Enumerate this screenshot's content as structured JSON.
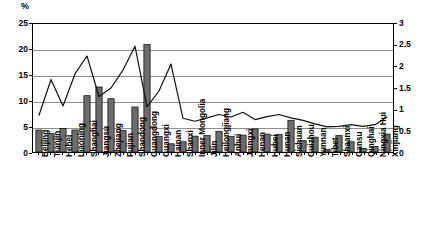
{
  "axes": {
    "left_unit_label": "%",
    "left_ticks": [
      "0",
      "5",
      "10",
      "15",
      "20",
      "25"
    ],
    "right_ticks": [
      "0",
      "0.5",
      "1",
      "1.5",
      "2",
      "2.5",
      "3"
    ]
  },
  "chart_data": {
    "type": "bar",
    "title": "",
    "subtitle": "",
    "xlabel": "",
    "ylabel": "%",
    "ylim": [
      0,
      25
    ],
    "y2lim": [
      0,
      3
    ],
    "grid": true,
    "legend": "none",
    "categories": [
      "Beijing",
      "Tianjin",
      "Hebei",
      "Liaoning",
      "Shanghai",
      "Jiangsu",
      "Zhejiang",
      "Fujian",
      "Shandong",
      "Guangdong",
      "Guangxi",
      "Hainan",
      "Shanxi",
      "Inner Mongolia",
      "Jilin",
      "Heilongjiang",
      "Anhui",
      "Jaingxi",
      "Henan",
      "Hubei",
      "Hunan",
      "Sichuan",
      "Guizhou",
      "Yunnan",
      "Tibet",
      "Shaanxi",
      "Gansu",
      "Qinghai",
      "Ningxia Hui",
      "Xinjiang"
    ],
    "series": [
      {
        "name": "bars",
        "axis": "left",
        "type": "bar",
        "color": "#6d6d6d",
        "values": [
          4.3,
          3.6,
          4.6,
          4.3,
          11.0,
          12.7,
          10.4,
          4.2,
          8.8,
          21.0,
          3.0,
          1.6,
          2.0,
          3.1,
          3.2,
          4.0,
          3.0,
          3.3,
          4.5,
          3.5,
          3.4,
          6.2,
          2.2,
          2.9,
          0.5,
          3.2,
          2.0,
          0.7,
          1.1,
          3.5
        ]
      },
      {
        "name": "line",
        "axis": "right",
        "type": "line",
        "color": "#111111",
        "values": [
          0.86,
          1.7,
          1.08,
          1.83,
          2.25,
          1.3,
          1.5,
          1.92,
          2.48,
          1.06,
          1.43,
          2.06,
          0.79,
          0.72,
          0.8,
          0.88,
          0.82,
          0.93,
          0.76,
          0.83,
          0.88,
          0.8,
          0.74,
          0.66,
          0.59,
          0.6,
          0.64,
          0.6,
          0.64,
          0.82
        ]
      }
    ]
  }
}
